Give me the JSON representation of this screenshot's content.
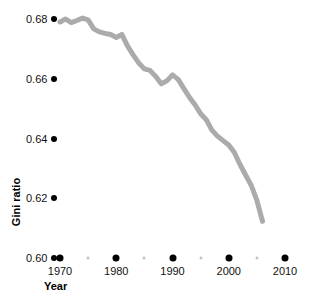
{
  "chart_data": {
    "type": "line",
    "title": "",
    "xlabel": "Year",
    "ylabel": "Gini ratio",
    "xlim": [
      1968.2,
      2011.5
    ],
    "ylim": [
      0.5985,
      0.6815
    ],
    "grid": false,
    "legend": null,
    "line_color": "#ababab",
    "line_width_px": 5,
    "tick_color_major": "#000000",
    "tick_color_minor": "#c2c2c2",
    "y_ticks": [
      "0.68",
      "0.66",
      "0.64",
      "0.62",
      "0.60"
    ],
    "y_tick_values": [
      0.68,
      0.66,
      0.64,
      0.62,
      0.6
    ],
    "x_ticks": [
      "1970",
      "1980",
      "1990",
      "2000",
      "2010"
    ],
    "x_tick_values": [
      1970,
      1980,
      1990,
      2000,
      2010
    ],
    "x_minor_ticks": [
      1975,
      1985,
      1995,
      2005
    ],
    "series": [
      {
        "name": "Gini ratio",
        "x": [
          1970,
          1971,
          1972,
          1973,
          1974,
          1975,
          1976,
          1977,
          1978,
          1979,
          1980,
          1981,
          1982,
          1983,
          1984,
          1985,
          1986,
          1987,
          1988,
          1989,
          1990,
          1991,
          1992,
          1993,
          1994,
          1995,
          1996,
          1997,
          1998,
          1999,
          2000,
          2001,
          2002,
          2003,
          2004,
          2005,
          2006
        ],
        "values": [
          0.679,
          0.68,
          0.6788,
          0.6795,
          0.6803,
          0.6797,
          0.6767,
          0.6757,
          0.6752,
          0.6748,
          0.6738,
          0.6748,
          0.671,
          0.668,
          0.6653,
          0.6633,
          0.6628,
          0.6608,
          0.6583,
          0.6593,
          0.6613,
          0.6598,
          0.6568,
          0.6538,
          0.6513,
          0.6483,
          0.6463,
          0.6428,
          0.6408,
          0.6393,
          0.6378,
          0.6353,
          0.6313,
          0.6278,
          0.6243,
          0.6193,
          0.6123
        ]
      }
    ]
  },
  "axis_titles": {
    "y": "Gini ratio",
    "x": "Year"
  }
}
